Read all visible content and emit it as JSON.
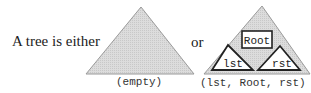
{
  "diagram": {
    "intro_text": "A tree is either",
    "connector_text": "or",
    "empty_case": {
      "label": "(empty)",
      "shape": "triangle",
      "fill": "#d9d9d9"
    },
    "node_case": {
      "label": "(lst, Root, rst)",
      "shape": "triangle",
      "fill": "#d9d9d9",
      "root_box_label": "Root",
      "left_subtree_label": "lst",
      "right_subtree_label": "rst"
    },
    "colors": {
      "triangle_fill": "#d9d9d9",
      "triangle_stroke": "#9a9a9a",
      "inner_stroke": "#222222",
      "inner_fill": "#ffffff"
    }
  }
}
